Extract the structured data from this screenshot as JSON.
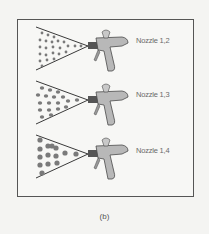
{
  "figure": {
    "caption": "(b)",
    "rows": [
      {
        "label": "Nozzle 1,2",
        "droplet_size": "small"
      },
      {
        "label": "Nozzle 1,3",
        "droplet_size": "medium"
      },
      {
        "label": "Nozzle 1,4",
        "droplet_size": "large"
      }
    ],
    "colors": {
      "droplet": "#7a7a7a",
      "outline": "#3a3a3a",
      "gun_body": "#b8b8b8",
      "frame_border": "#555555"
    }
  }
}
